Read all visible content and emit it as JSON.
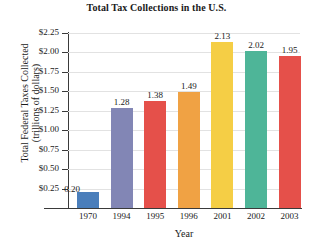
{
  "chart_data": {
    "type": "bar",
    "title": "Total Tax Collections in the U.S.",
    "xlabel": "Year",
    "ylabel_line1": "Total Federal Taxes Collected",
    "ylabel_line2": "(trillions of dollars)",
    "categories": [
      "1970",
      "1994",
      "1995",
      "1996",
      "2001",
      "2002",
      "2003"
    ],
    "values": [
      0.2,
      1.28,
      1.38,
      1.49,
      2.13,
      2.02,
      1.95
    ],
    "value_labels": [
      "0.20",
      "1.28",
      "1.38",
      "1.49",
      "2.13",
      "2.02",
      "1.95"
    ],
    "bar_colors": [
      "#4a7ebb",
      "#8286b5",
      "#e5504a",
      "#f0a244",
      "#f5ce45",
      "#4eb598",
      "#e5504a"
    ],
    "ylim": [
      0,
      2.25
    ],
    "ytick_values": [
      2.25,
      2.0,
      1.75,
      1.5,
      1.25,
      1.0,
      0.75,
      0.5,
      0.25
    ],
    "ytick_labels": [
      "$2.25",
      "$2.00",
      "$1.75",
      "$1.50",
      "$1.25",
      "$1.00",
      "$0.75",
      "$0.50",
      "$0.25"
    ],
    "grid": true,
    "grid_color": "#e2e2e2",
    "legend": false,
    "axis_color": "#3a3a3a",
    "background": "#ffffff"
  }
}
